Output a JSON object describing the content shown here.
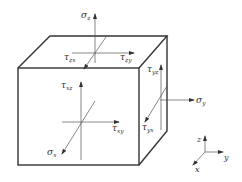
{
  "diagram": {
    "cube": {
      "front_face": {
        "x": 18,
        "y": 68,
        "w": 121,
        "h": 97
      },
      "depth_offset": {
        "dx": 28,
        "dy": -32
      },
      "edge_color": "#333333"
    },
    "labels": {
      "sigma_z": {
        "sym": "σ",
        "sub": "z"
      },
      "tau_zx": {
        "sym": "τ",
        "sub": "zx"
      },
      "tau_zy": {
        "sym": "τ",
        "sub": "zy"
      },
      "tau_xz": {
        "sym": "τ",
        "sub": "xz"
      },
      "tau_xy": {
        "sym": "τ",
        "sub": "xy"
      },
      "sigma_x": {
        "sym": "σ",
        "sub": "x"
      },
      "tau_yz": {
        "sym": "τ",
        "sub": "yz"
      },
      "tau_yx": {
        "sym": "τ",
        "sub": "yx"
      },
      "sigma_y": {
        "sym": "σ",
        "sub": "y"
      }
    },
    "axes": {
      "z": "z",
      "y": "y",
      "x": "x"
    }
  }
}
